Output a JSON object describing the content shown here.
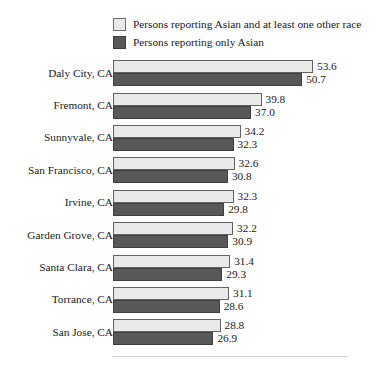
{
  "legend": {
    "entries": [
      {
        "label": "Persons reporting Asian and at least one other race",
        "swatch": "light",
        "color": "#e9e9e9"
      },
      {
        "label": "Persons reporting only Asian",
        "swatch": "dark",
        "color": "#585858"
      }
    ]
  },
  "chart_data": {
    "type": "bar",
    "orientation": "horizontal",
    "title": "",
    "subtitle": "",
    "xlabel": "",
    "ylabel": "",
    "grid": false,
    "legend_position": "top",
    "xlim": [
      0,
      53.6
    ],
    "categories": [
      "Daly City, CA",
      "Fremont, CA",
      "Sunnyvale, CA",
      "San Francisco, CA",
      "Irvine, CA",
      "Garden Grove, CA",
      "Santa Clara, CA",
      "Torrance, CA",
      "San Jose, CA"
    ],
    "series": [
      {
        "name": "Persons reporting Asian and at least one other race",
        "color": "#e9e9e9",
        "values": [
          53.6,
          39.8,
          34.2,
          32.6,
          32.3,
          32.2,
          31.4,
          31.1,
          28.8
        ],
        "labels": [
          "53.6",
          "39.8",
          "34.2",
          "32.6",
          "32.3",
          "32.2",
          "31.4",
          "31.1",
          "28.8"
        ]
      },
      {
        "name": "Persons reporting only Asian",
        "color": "#585858",
        "values": [
          50.7,
          37.0,
          32.3,
          30.8,
          29.8,
          30.9,
          29.3,
          28.6,
          26.9
        ],
        "labels": [
          "50.7",
          "37.0",
          "32.3",
          "30.8",
          "29.8",
          "30.9",
          "29.3",
          "28.6",
          "26.9"
        ]
      }
    ]
  }
}
